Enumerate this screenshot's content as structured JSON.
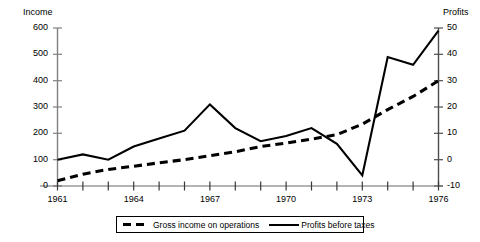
{
  "axes": {
    "left_title": "Income",
    "right_title": "Profits",
    "left_ticks": [
      "600",
      "500",
      "400",
      "300",
      "200",
      "100",
      "0"
    ],
    "right_ticks": [
      "50",
      "40",
      "30",
      "20",
      "10",
      "0",
      "-10"
    ],
    "x_ticks": [
      "1961",
      "1964",
      "1967",
      "1970",
      "1973",
      "1976"
    ]
  },
  "legend": {
    "series1_label": "Gross income on operations",
    "series2_label": "Profits before taxes"
  },
  "chart_data": {
    "type": "line",
    "title": "",
    "xlabel": "",
    "ylabel": "Income",
    "y2label": "Profits",
    "grid": false,
    "legend_position": "bottom",
    "x": [
      1961,
      1962,
      1963,
      1964,
      1965,
      1966,
      1967,
      1968,
      1969,
      1970,
      1971,
      1972,
      1973,
      1974,
      1975,
      1976
    ],
    "xlim": [
      1961,
      1976
    ],
    "ylim": [
      0,
      600
    ],
    "y2lim": [
      -10,
      50
    ],
    "series": [
      {
        "name": "Gross income on operations",
        "axis": "left",
        "style": "dashed",
        "values": [
          20,
          45,
          63,
          75,
          88,
          100,
          115,
          130,
          150,
          163,
          178,
          195,
          235,
          290,
          340,
          400
        ]
      },
      {
        "name": "Profits before taxes",
        "axis": "right",
        "style": "solid",
        "values": [
          0,
          2,
          0,
          5,
          8,
          11,
          21,
          12,
          7,
          9,
          12,
          6,
          -6,
          39,
          36,
          49
        ]
      }
    ],
    "series_income_equivalent": {
      "name": "Profits before taxes (in income scale)",
      "values": [
        100,
        120,
        100,
        150,
        180,
        210,
        310,
        220,
        170,
        190,
        220,
        160,
        40,
        490,
        460,
        590
      ]
    }
  }
}
